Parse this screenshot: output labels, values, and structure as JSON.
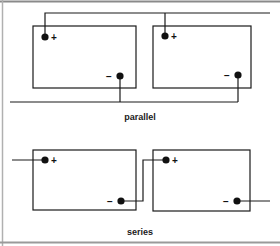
{
  "colors": {
    "ink": "#1a1a1a",
    "frame": "#8a8a8a",
    "background": "#ffffff"
  },
  "diagrams": {
    "parallel": {
      "label": "parallel",
      "batteries": [
        {
          "positive_sign": "+",
          "negative_sign": "−"
        },
        {
          "positive_sign": "+",
          "negative_sign": "−"
        }
      ]
    },
    "series": {
      "label": "series",
      "batteries": [
        {
          "positive_sign": "+",
          "negative_sign": "−"
        },
        {
          "positive_sign": "+",
          "negative_sign": "−"
        }
      ]
    }
  }
}
